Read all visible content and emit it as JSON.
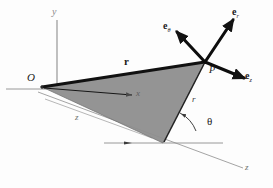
{
  "figure": {
    "type": "vector-diagram",
    "background_color": "#fdfdfd",
    "ink_color": "#1a1a1a",
    "triangle_fill": "#8e8e8e",
    "triangle_edge": "#5a5a5a",
    "axis_color": "#6e6e6e",
    "thin_line_color": "#9a9a9a"
  },
  "labels": {
    "origin": "O",
    "point": "P",
    "axis_y": "y",
    "axis_x": "x",
    "axis_z": "z",
    "dimension_z": "z",
    "radius_scalar": "r",
    "position_vector": "r",
    "angle_theta": "θ",
    "unit_r_base": "e",
    "unit_r_sub": "r",
    "unit_theta_base": "e",
    "unit_theta_sub": "θ",
    "unit_z_base": "e",
    "unit_z_sub": "z"
  },
  "geometry": {
    "origin_point": [
      42,
      87
    ],
    "point_p": [
      205,
      62
    ],
    "base_point": [
      163,
      143
    ],
    "y_axis_top": [
      57,
      12
    ],
    "x_axis_tip": [
      134,
      95
    ],
    "z_axis_far": [
      243,
      166
    ],
    "triangle_vertices": [
      [
        42,
        87
      ],
      [
        205,
        62
      ],
      [
        163,
        143
      ]
    ],
    "unit_vector_r_tip": [
      233,
      18
    ],
    "unit_vector_theta_tip": [
      176,
      31
    ],
    "unit_vector_z_tip": [
      245,
      79
    ]
  }
}
